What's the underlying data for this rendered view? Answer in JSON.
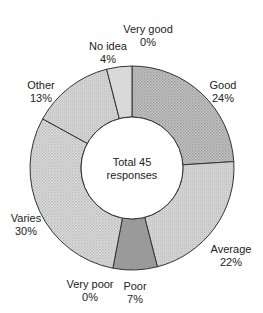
{
  "chart_data": {
    "type": "pie",
    "variant": "donut",
    "title": "",
    "center_label": [
      "Total 45",
      "responses"
    ],
    "total": 45,
    "start_angle": "12 o'clock",
    "direction": "clockwise",
    "categories": [
      "Very good",
      "Good",
      "Average",
      "Poor",
      "Very poor",
      "Varies",
      "Other",
      "No idea"
    ],
    "values": [
      0,
      24,
      22,
      7,
      0,
      30,
      13,
      4
    ],
    "unit": "%",
    "legend": "none (direct labels)",
    "slices": [
      {
        "label": "Very good",
        "value": 0,
        "pct": "0%",
        "fill": "#cfcfcf",
        "pattern": "none"
      },
      {
        "label": "Good",
        "value": 24,
        "pct": "24%",
        "fill": "#b8b8b8",
        "pattern": "dots-dense"
      },
      {
        "label": "Average",
        "value": 22,
        "pct": "22%",
        "fill": "#cccccc",
        "pattern": "fine"
      },
      {
        "label": "Poor",
        "value": 7,
        "pct": "7%",
        "fill": "#9a9a9a",
        "pattern": "solid"
      },
      {
        "label": "Very poor",
        "value": 0,
        "pct": "0%",
        "fill": "#bbbbbb",
        "pattern": "none"
      },
      {
        "label": "Varies",
        "value": 30,
        "pct": "30%",
        "fill": "#d0d0d0",
        "pattern": "dots-light"
      },
      {
        "label": "Other",
        "value": 13,
        "pct": "13%",
        "fill": "#cfcfcf",
        "pattern": "fine"
      },
      {
        "label": "No idea",
        "value": 4,
        "pct": "4%",
        "fill": "#d9d9d9",
        "pattern": "solid"
      }
    ]
  },
  "labels": {
    "very_good": {
      "name": "Very good",
      "pct": "0%"
    },
    "good": {
      "name": "Good",
      "pct": "24%"
    },
    "average": {
      "name": "Average",
      "pct": "22%"
    },
    "poor": {
      "name": "Poor",
      "pct": "7%"
    },
    "very_poor": {
      "name": "Very poor",
      "pct": "0%"
    },
    "varies": {
      "name": "Varies",
      "pct": "30%"
    },
    "other": {
      "name": "Other",
      "pct": "13%"
    },
    "no_idea": {
      "name": "No idea",
      "pct": "4%"
    }
  },
  "center": {
    "line1": "Total 45",
    "line2": "responses"
  }
}
